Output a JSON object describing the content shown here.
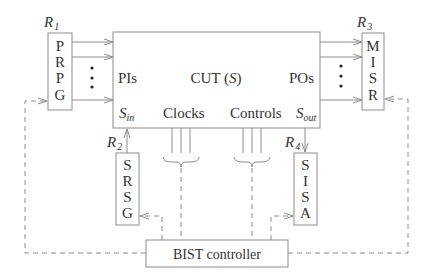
{
  "diagram": {
    "type": "block-diagram",
    "colors": {
      "stroke": "#8c8c8c",
      "text": "#333333",
      "background": "#ffffff"
    },
    "cut": {
      "label": "CUT (",
      "var": "S",
      "close": ")",
      "pis": "PIs",
      "pos": "POs",
      "sin_main": "S",
      "sin_sub": "in",
      "sout_main": "S",
      "sout_sub": "out",
      "clocks": "Clocks",
      "controls": "Controls"
    },
    "registers": {
      "r1": {
        "name": "R",
        "index": "1",
        "letters": [
          "P",
          "R",
          "P",
          "G"
        ]
      },
      "r2": {
        "name": "R",
        "index": "2",
        "letters": [
          "S",
          "R",
          "S",
          "G"
        ]
      },
      "r3": {
        "name": "R",
        "index": "3",
        "letters": [
          "M",
          "I",
          "S",
          "R"
        ]
      },
      "r4": {
        "name": "R",
        "index": "4",
        "letters": [
          "S",
          "I",
          "S",
          "A"
        ]
      }
    },
    "controller": {
      "label": "BIST controller"
    }
  }
}
